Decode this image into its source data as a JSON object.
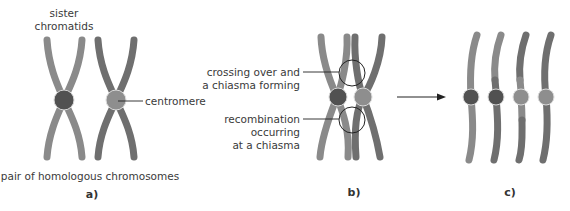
{
  "panels": {
    "a": {
      "caption": "a)",
      "labels": {
        "sister_line1": "sister",
        "sister_line2": "chromatids",
        "centromere": "centromere",
        "pair": "pair of homologous chromosomes"
      }
    },
    "b": {
      "caption": "b)",
      "labels": {
        "crossing_line1": "crossing over and",
        "crossing_line2": "a chiasma forming",
        "recomb_line1": "recombination",
        "recomb_line2": "occurring",
        "recomb_line3": "at a chiasma"
      }
    },
    "c": {
      "caption": "c)"
    }
  },
  "colors": {
    "chromatid_light": "#8c8c8c",
    "chromatid_dark": "#6c6c6c",
    "centromere_dark": "#515151",
    "centromere_light": "#8e8e8e",
    "outline": "#d8d8d8",
    "line": "#222222"
  }
}
